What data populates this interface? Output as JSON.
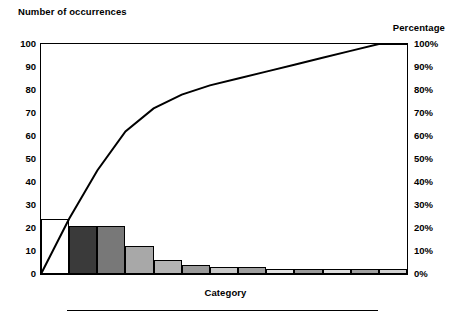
{
  "chart_data": {
    "type": "bar",
    "title": "",
    "ylabel": "Number of occurrences",
    "xlabel": "Category",
    "y2label": "Percentage",
    "categories": [
      "1",
      "2",
      "3",
      "4",
      "5",
      "6",
      "7",
      "8",
      "9",
      "10",
      "11",
      "12",
      "13"
    ],
    "values": [
      24,
      21,
      21,
      12,
      6,
      4,
      3,
      3,
      2,
      2,
      2,
      2,
      2
    ],
    "ylim": [
      0,
      100
    ],
    "yticks": [
      0,
      10,
      20,
      30,
      40,
      50,
      60,
      70,
      80,
      90,
      100
    ],
    "ytick_labels": [
      "0",
      "10",
      "20",
      "30",
      "40",
      "50",
      "60",
      "70",
      "80",
      "90",
      "100"
    ],
    "y2lim": [
      0,
      100
    ],
    "y2ticks": [
      0,
      10,
      20,
      30,
      40,
      50,
      60,
      70,
      80,
      90,
      100
    ],
    "y2tick_labels": [
      "0%",
      "10%",
      "20%",
      "30%",
      "40%",
      "50%",
      "60%",
      "70%",
      "80%",
      "90%",
      "100%"
    ],
    "cumulative_percent": [
      24,
      45,
      66,
      78,
      84,
      88,
      91,
      94,
      96,
      98,
      100,
      100,
      100
    ],
    "line_points_percent": [
      0,
      24,
      45,
      62,
      72,
      78,
      82,
      85,
      88,
      91,
      94,
      97,
      100,
      100
    ],
    "bar_fills": [
      "#ffffff",
      "#3a3a3a",
      "#787878",
      "#a8a8a8",
      "#b4b4b4",
      "#9a9a9a",
      "#c8c8c8",
      "#9e9e9e",
      "#e0e0e0",
      "#9a9a9a",
      "#dcdcdc",
      "#a0a0a0",
      "#d0d0d0"
    ],
    "grid": false,
    "legend": "none",
    "line_color": "#000000",
    "axis_color": "#000000"
  },
  "labels": {
    "y_axis_title": "Number of occurrences",
    "y2_axis_title": "Percentage",
    "x_axis_title": "Category"
  }
}
